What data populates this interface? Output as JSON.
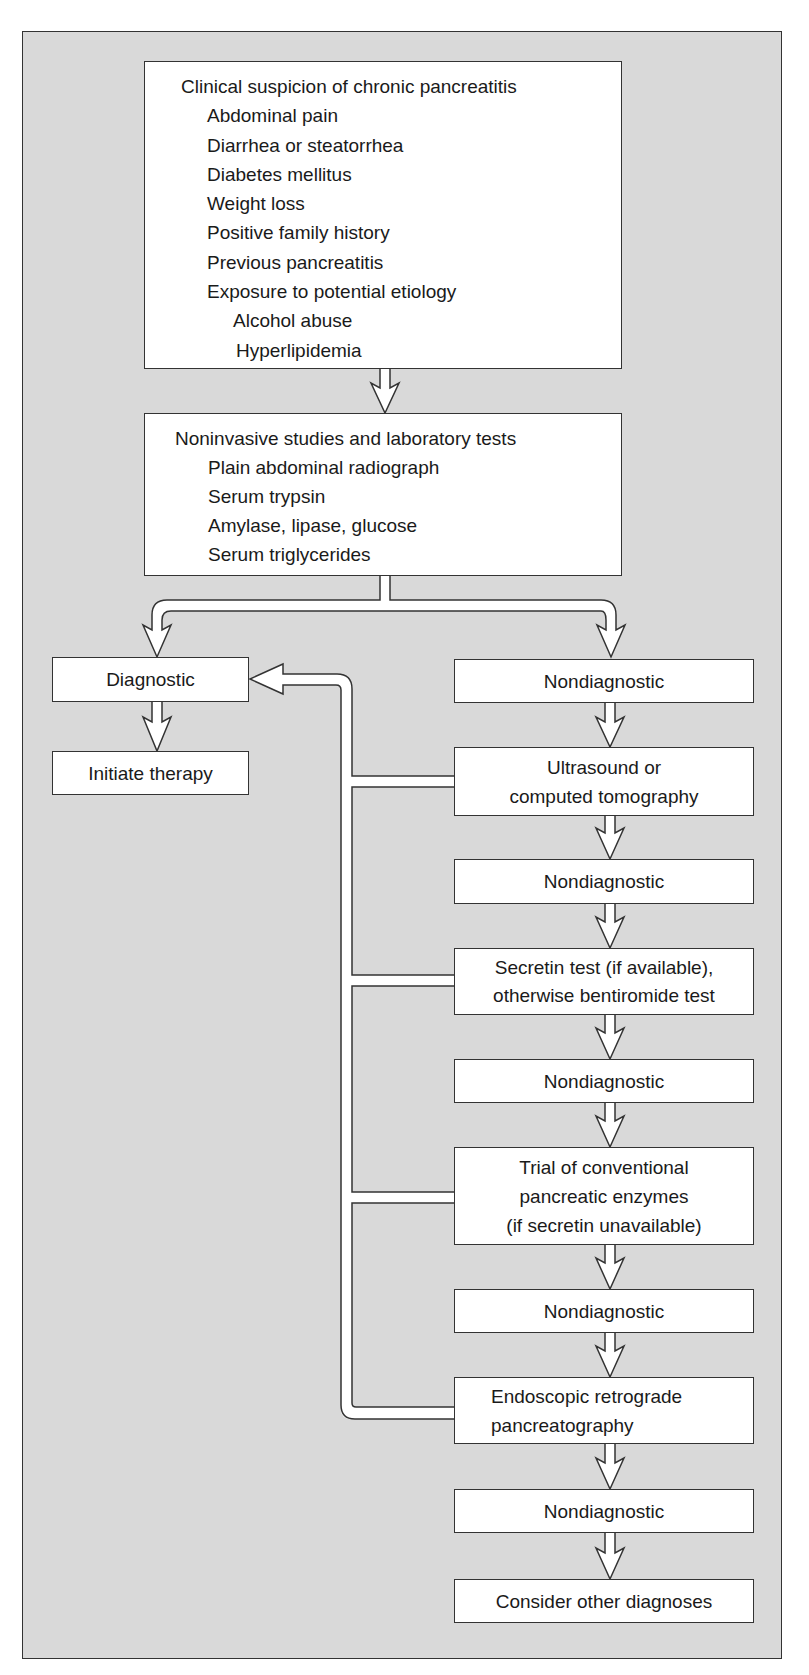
{
  "diagram": {
    "type": "flowchart",
    "background_color": "#d9d9d9",
    "box_color": "#ffffff",
    "border_color": "#333333",
    "nodes": {
      "clinical_suspicion": {
        "title": "Clinical suspicion of chronic pancreatitis",
        "items": [
          "Abdominal pain",
          "Diarrhea or steatorrhea",
          "Diabetes mellitus",
          "Weight loss",
          "Positive family history",
          "Previous pancreatitis",
          "Exposure to potential etiology"
        ],
        "sub_items": [
          "Alcohol abuse",
          "Hyperlipidemia"
        ]
      },
      "noninvasive": {
        "title": "Noninvasive studies and laboratory tests",
        "items": [
          "Plain abdominal radiograph",
          "Serum trypsin",
          "Amylase, lipase, glucose",
          "Serum triglycerides"
        ]
      },
      "diagnostic": {
        "label": "Diagnostic"
      },
      "initiate_therapy": {
        "label": "Initiate therapy"
      },
      "nondiagnostic_1": {
        "label": "Nondiagnostic"
      },
      "ultrasound": {
        "lines": [
          "Ultrasound or",
          "computed tomography"
        ]
      },
      "nondiagnostic_2": {
        "label": "Nondiagnostic"
      },
      "secretin": {
        "lines": [
          "Secretin test (if available),",
          "otherwise bentiromide test"
        ]
      },
      "nondiagnostic_3": {
        "label": "Nondiagnostic"
      },
      "trial_enzymes": {
        "lines": [
          "Trial of conventional",
          "pancreatic enzymes",
          "(if secretin unavailable)"
        ]
      },
      "nondiagnostic_4": {
        "label": "Nondiagnostic"
      },
      "ercp": {
        "lines": [
          "Endoscopic retrograde",
          "pancreatography"
        ]
      },
      "nondiagnostic_5": {
        "label": "Nondiagnostic"
      },
      "other_diagnoses": {
        "label": "Consider other diagnoses"
      }
    },
    "edges": [
      [
        "clinical_suspicion",
        "noninvasive"
      ],
      [
        "noninvasive",
        "diagnostic"
      ],
      [
        "noninvasive",
        "nondiagnostic_1"
      ],
      [
        "diagnostic",
        "initiate_therapy"
      ],
      [
        "nondiagnostic_1",
        "ultrasound"
      ],
      [
        "ultrasound",
        "nondiagnostic_2"
      ],
      [
        "ultrasound",
        "diagnostic"
      ],
      [
        "nondiagnostic_2",
        "secretin"
      ],
      [
        "secretin",
        "nondiagnostic_3"
      ],
      [
        "secretin",
        "diagnostic"
      ],
      [
        "nondiagnostic_3",
        "trial_enzymes"
      ],
      [
        "trial_enzymes",
        "nondiagnostic_4"
      ],
      [
        "trial_enzymes",
        "diagnostic"
      ],
      [
        "nondiagnostic_4",
        "ercp"
      ],
      [
        "ercp",
        "nondiagnostic_5"
      ],
      [
        "ercp",
        "diagnostic"
      ],
      [
        "nondiagnostic_5",
        "other_diagnoses"
      ]
    ]
  }
}
